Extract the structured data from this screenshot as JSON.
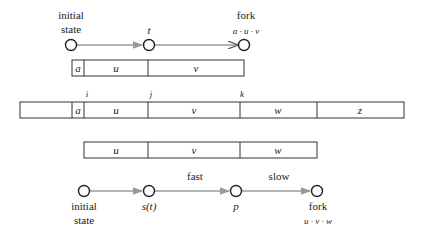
{
  "top_path": {
    "nodes": [
      {
        "label_line1": "initial",
        "label_line2": "state"
      },
      {
        "label": "t"
      },
      {
        "label_line1": "fork",
        "label_line2": "a · u · v"
      }
    ]
  },
  "strip_top": {
    "cells": [
      "a",
      "u",
      "v"
    ]
  },
  "strip_main": {
    "markers": [
      "i",
      "j",
      "k"
    ],
    "cells": [
      "",
      "a",
      "u",
      "v",
      "w",
      "z"
    ]
  },
  "strip_bottom": {
    "cells": [
      "u",
      "v",
      "w"
    ]
  },
  "bottom_path": {
    "nodes": [
      {
        "label_line1": "initial",
        "label_line2": "state"
      },
      {
        "label": "s(t)"
      },
      {
        "label": "p"
      },
      {
        "label_line1": "fork",
        "label_line2": "u · v · w"
      }
    ],
    "edges": [
      {
        "label": ""
      },
      {
        "label": "fast"
      },
      {
        "label": "slow"
      }
    ]
  },
  "colors": {
    "arrow": "#9a9a9a",
    "outline": "#333333"
  }
}
